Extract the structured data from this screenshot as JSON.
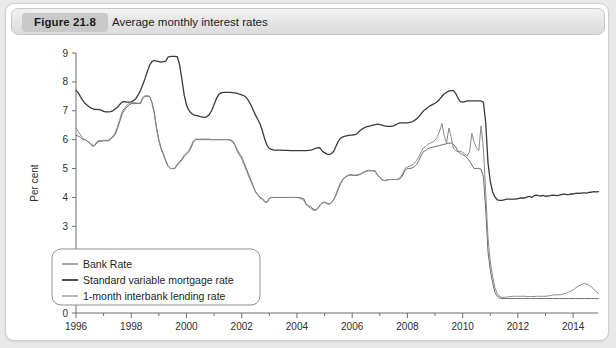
{
  "header": {
    "figure_badge": "Figure 21.8",
    "title": "Average monthly interest rates"
  },
  "chart_data": {
    "type": "line",
    "title": "Average monthly interest rates",
    "xlabel": "",
    "ylabel": "Per cent",
    "xlim": [
      1996,
      2014.9
    ],
    "ylim": [
      0,
      9
    ],
    "grid": false,
    "legend_position": "bottom-left",
    "y_ticks": [
      "0",
      "1",
      "2",
      "3",
      "4",
      "5",
      "6",
      "7",
      "8",
      "9"
    ],
    "y_tick_values": [
      0,
      1,
      2,
      3,
      4,
      5,
      6,
      7,
      8,
      9
    ],
    "x_ticks": [
      "1996",
      "1998",
      "2000",
      "2002",
      "2004",
      "2006",
      "2008",
      "2010",
      "2012",
      "2014"
    ],
    "x_tick_values": [
      1996,
      1998,
      2000,
      2002,
      2004,
      2006,
      2008,
      2010,
      2012,
      2014
    ],
    "x_minor_step": 1,
    "colors": {
      "bank_rate": "#6b6b6b",
      "standard_variable_mortgage_rate": "#3a3a3a",
      "interbank_rate": "#8a8a8a"
    },
    "series": [
      {
        "name": "Standard variable mortgage rate",
        "color": "#3a3a3a",
        "width": 1.3,
        "x_start": 1996.0,
        "x_step": 0.0833333,
        "values": [
          7.7,
          7.62,
          7.48,
          7.35,
          7.25,
          7.18,
          7.12,
          7.08,
          7.05,
          7.05,
          7.04,
          7.02,
          6.98,
          6.96,
          6.96,
          6.97,
          7.0,
          7.06,
          7.12,
          7.22,
          7.3,
          7.32,
          7.3,
          7.3,
          7.31,
          7.35,
          7.42,
          7.55,
          7.7,
          7.9,
          8.12,
          8.36,
          8.58,
          8.7,
          8.74,
          8.72,
          8.7,
          8.68,
          8.7,
          8.72,
          8.86,
          8.88,
          8.88,
          8.88,
          8.87,
          8.6,
          8.1,
          7.55,
          7.2,
          7.02,
          6.92,
          6.86,
          6.84,
          6.82,
          6.8,
          6.78,
          6.77,
          6.8,
          6.88,
          7.02,
          7.22,
          7.42,
          7.56,
          7.62,
          7.64,
          7.64,
          7.64,
          7.64,
          7.63,
          7.62,
          7.6,
          7.58,
          7.55,
          7.52,
          7.46,
          7.34,
          7.2,
          7.02,
          6.85,
          6.7,
          6.54,
          6.3,
          6.02,
          5.8,
          5.7,
          5.66,
          5.64,
          5.64,
          5.64,
          5.64,
          5.63,
          5.63,
          5.63,
          5.62,
          5.62,
          5.62,
          5.62,
          5.62,
          5.62,
          5.62,
          5.62,
          5.63,
          5.64,
          5.66,
          5.7,
          5.72,
          5.72,
          5.6,
          5.55,
          5.5,
          5.48,
          5.52,
          5.6,
          5.78,
          5.95,
          6.05,
          6.1,
          6.12,
          6.14,
          6.16,
          6.16,
          6.17,
          6.2,
          6.28,
          6.35,
          6.4,
          6.44,
          6.46,
          6.48,
          6.5,
          6.52,
          6.54,
          6.52,
          6.5,
          6.48,
          6.46,
          6.46,
          6.46,
          6.48,
          6.52,
          6.56,
          6.58,
          6.58,
          6.58,
          6.58,
          6.6,
          6.62,
          6.66,
          6.72,
          6.8,
          6.9,
          7.0,
          7.06,
          7.12,
          7.18,
          7.22,
          7.26,
          7.32,
          7.4,
          7.5,
          7.58,
          7.64,
          7.68,
          7.7,
          7.7,
          7.6,
          7.44,
          7.32,
          7.3,
          7.32,
          7.34,
          7.34,
          7.34,
          7.34,
          7.34,
          7.34,
          7.34,
          7.3,
          6.6,
          5.2,
          4.56,
          4.2,
          4.02,
          3.92,
          3.9,
          3.9,
          3.92,
          3.94,
          3.94,
          3.94,
          3.94,
          3.94,
          3.96,
          3.98,
          3.98,
          3.98,
          4.02,
          4.04,
          4.0,
          4.06,
          4.08,
          4.06,
          4.05,
          4.07,
          4.04,
          4.05,
          4.06,
          4.08,
          4.07,
          4.06,
          4.08,
          4.1,
          4.12,
          4.1,
          4.1,
          4.12,
          4.12,
          4.14,
          4.15,
          4.14,
          4.16,
          4.16,
          4.15,
          4.18,
          4.18,
          4.2,
          4.19,
          4.2,
          4.22,
          4.24,
          4.26,
          4.28,
          4.28,
          4.3,
          4.3,
          4.31,
          4.32,
          4.32,
          4.33,
          4.33,
          4.34,
          4.34,
          4.34,
          4.34,
          4.35,
          4.35,
          4.35,
          4.35,
          4.35,
          4.35,
          4.34,
          4.34,
          4.34,
          4.34,
          4.34,
          4.34,
          4.34,
          4.34,
          4.34,
          4.34,
          4.34,
          4.34,
          4.34,
          4.34,
          4.34,
          4.34,
          4.34,
          4.34,
          4.34,
          4.34,
          4.34,
          4.34
        ]
      },
      {
        "name": "Bank Rate",
        "color": "#6b6b6b",
        "width": 1.0,
        "x_start": 1996.0,
        "x_step": 0.0833333,
        "values": [
          6.15,
          6.12,
          6.08,
          6.0,
          6.0,
          5.94,
          5.88,
          5.78,
          5.78,
          5.88,
          5.95,
          5.94,
          5.96,
          5.96,
          5.96,
          6.0,
          6.08,
          6.18,
          6.38,
          6.62,
          6.88,
          7.02,
          7.12,
          7.2,
          7.25,
          7.25,
          7.25,
          7.25,
          7.25,
          7.42,
          7.5,
          7.5,
          7.5,
          7.3,
          6.96,
          6.42,
          6.0,
          5.7,
          5.5,
          5.28,
          5.1,
          5.0,
          5.0,
          5.0,
          5.12,
          5.2,
          5.3,
          5.42,
          5.5,
          5.58,
          5.72,
          5.92,
          6.0,
          6.0,
          6.0,
          6.0,
          6.0,
          6.0,
          6.0,
          6.0,
          6.0,
          6.0,
          6.0,
          6.0,
          6.0,
          6.0,
          6.0,
          6.0,
          5.96,
          5.84,
          5.66,
          5.52,
          5.4,
          5.2,
          5.0,
          4.8,
          4.6,
          4.4,
          4.2,
          4.1,
          4.0,
          3.96,
          3.86,
          3.84,
          3.98,
          4.0,
          4.0,
          4.0,
          4.0,
          4.0,
          4.0,
          4.0,
          4.0,
          4.0,
          4.0,
          4.0,
          4.0,
          4.0,
          3.98,
          3.95,
          3.78,
          3.72,
          3.68,
          3.6,
          3.58,
          3.62,
          3.74,
          3.82,
          3.84,
          3.8,
          3.78,
          3.82,
          3.92,
          4.08,
          4.3,
          4.48,
          4.62,
          4.7,
          4.74,
          4.78,
          4.76,
          4.76,
          4.76,
          4.78,
          4.82,
          4.86,
          4.9,
          4.92,
          4.92,
          4.92,
          4.92,
          4.78,
          4.7,
          4.62,
          4.58,
          4.6,
          4.62,
          4.62,
          4.62,
          4.62,
          4.62,
          4.66,
          4.78,
          4.94,
          5.0,
          5.0,
          5.02,
          5.06,
          5.14,
          5.28,
          5.46,
          5.6,
          5.62,
          5.7,
          5.72,
          5.74,
          5.76,
          5.78,
          5.8,
          5.82,
          5.84,
          5.86,
          5.88,
          5.88,
          5.84,
          5.74,
          5.6,
          5.52,
          5.48,
          5.44,
          5.36,
          5.26,
          5.12,
          5.0,
          5.0,
          5.0,
          4.98,
          4.72,
          3.6,
          2.12,
          1.48,
          1.06,
          0.72,
          0.58,
          0.52,
          0.5,
          0.5,
          0.5,
          0.5,
          0.5,
          0.5,
          0.5,
          0.5,
          0.5,
          0.5,
          0.5,
          0.5,
          0.5,
          0.5,
          0.5,
          0.5,
          0.5,
          0.5,
          0.5,
          0.5,
          0.5,
          0.5,
          0.5,
          0.5,
          0.5,
          0.5,
          0.5,
          0.5,
          0.5,
          0.5,
          0.5,
          0.5,
          0.5,
          0.5,
          0.5,
          0.5,
          0.5,
          0.5,
          0.5,
          0.5,
          0.5,
          0.5,
          0.5,
          0.5,
          0.5,
          0.5,
          0.5,
          0.5,
          0.5,
          0.5,
          0.5,
          0.5,
          0.5,
          0.5,
          0.5,
          0.5,
          0.5,
          0.5,
          0.5,
          0.5,
          0.5,
          0.5,
          0.5,
          0.5,
          0.5,
          0.5,
          0.5,
          0.5,
          0.5,
          0.5,
          0.5,
          0.5,
          0.5,
          0.5,
          0.5,
          0.5,
          0.5,
          0.5,
          0.5,
          0.5,
          0.5,
          0.5,
          0.5,
          0.5,
          0.5,
          0.5,
          0.5
        ]
      },
      {
        "name": "1-month interbank lending rate",
        "color": "#8a8a8a",
        "width": 1.0,
        "x_start": 1996.0,
        "x_step": 0.0833333,
        "values": [
          6.4,
          6.28,
          6.16,
          6.04,
          6.0,
          5.95,
          5.9,
          5.82,
          5.8,
          5.92,
          5.98,
          5.96,
          5.98,
          5.98,
          5.98,
          6.04,
          6.12,
          6.24,
          6.44,
          6.7,
          6.96,
          7.08,
          7.18,
          7.26,
          7.28,
          7.28,
          7.28,
          7.26,
          7.28,
          7.46,
          7.52,
          7.52,
          7.5,
          7.26,
          6.9,
          6.36,
          5.96,
          5.66,
          5.46,
          5.24,
          5.08,
          5.0,
          5.0,
          5.02,
          5.16,
          5.24,
          5.34,
          5.46,
          5.54,
          5.62,
          5.78,
          5.96,
          6.02,
          6.02,
          6.02,
          6.02,
          6.02,
          6.02,
          6.02,
          6.0,
          6.0,
          6.0,
          6.0,
          6.0,
          6.0,
          6.0,
          6.0,
          5.98,
          5.92,
          5.8,
          5.6,
          5.46,
          5.34,
          5.14,
          4.94,
          4.74,
          4.56,
          4.36,
          4.18,
          4.08,
          3.98,
          3.94,
          3.84,
          3.82,
          3.96,
          4.0,
          4.0,
          4.0,
          4.0,
          4.0,
          4.0,
          4.0,
          4.0,
          4.0,
          4.0,
          4.0,
          4.0,
          3.98,
          3.94,
          3.9,
          3.74,
          3.68,
          3.62,
          3.56,
          3.54,
          3.6,
          3.72,
          3.8,
          3.82,
          3.78,
          3.76,
          3.82,
          3.94,
          4.12,
          4.34,
          4.52,
          4.64,
          4.72,
          4.76,
          4.8,
          4.78,
          4.78,
          4.78,
          4.8,
          4.84,
          4.88,
          4.92,
          4.94,
          4.94,
          4.92,
          4.9,
          4.76,
          4.68,
          4.6,
          4.58,
          4.6,
          4.62,
          4.62,
          4.62,
          4.62,
          4.64,
          4.7,
          4.84,
          5.0,
          5.06,
          5.08,
          5.12,
          5.18,
          5.28,
          5.42,
          5.58,
          5.72,
          5.76,
          5.84,
          5.88,
          5.92,
          5.98,
          6.1,
          6.3,
          6.56,
          6.12,
          5.88,
          6.4,
          6.08,
          5.7,
          5.62,
          5.58,
          5.6,
          5.56,
          5.5,
          5.44,
          5.58,
          6.22,
          5.9,
          5.72,
          5.62,
          6.48,
          5.7,
          4.2,
          2.6,
          1.8,
          1.26,
          0.88,
          0.68,
          0.58,
          0.54,
          0.54,
          0.55,
          0.56,
          0.57,
          0.58,
          0.58,
          0.58,
          0.58,
          0.58,
          0.58,
          0.57,
          0.57,
          0.57,
          0.57,
          0.58,
          0.58,
          0.58,
          0.58,
          0.58,
          0.59,
          0.6,
          0.62,
          0.63,
          0.63,
          0.63,
          0.64,
          0.66,
          0.68,
          0.72,
          0.76,
          0.8,
          0.86,
          0.92,
          0.96,
          1.0,
          1.02,
          1.0,
          0.96,
          0.9,
          0.82,
          0.74,
          0.68,
          0.64,
          0.6,
          0.58,
          0.56,
          0.55,
          0.54,
          0.53,
          0.53,
          0.52,
          0.52,
          0.52,
          0.52,
          0.52,
          0.52,
          0.51,
          0.51,
          0.51,
          0.51,
          0.51,
          0.51,
          0.51,
          0.51,
          0.51,
          0.51,
          0.51,
          0.51,
          0.51,
          0.51,
          0.51,
          0.51,
          0.51,
          0.51,
          0.51,
          0.51,
          0.51,
          0.51,
          0.51,
          0.51,
          0.51,
          0.51,
          0.51,
          0.51,
          0.51,
          0.51
        ]
      }
    ],
    "legend": [
      {
        "label": "Bank Rate",
        "color": "#6b6b6b",
        "width": 1.2
      },
      {
        "label": "Standard variable mortgage rate",
        "color": "#3a3a3a",
        "width": 1.8
      },
      {
        "label": "1-month interbank lending rate",
        "color": "#8a8a8a",
        "width": 1.2
      }
    ]
  }
}
